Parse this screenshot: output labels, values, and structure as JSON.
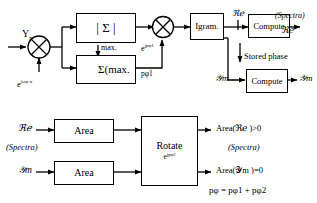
{
  "diagram": {
    "stroke_color": "#000000",
    "background": "#ffffff"
  },
  "top_section": {
    "input_label": "Y",
    "input_subscript": "n",
    "phase_ramp_label_base": "e",
    "phase_ramp_label_exp": "jωφ·n",
    "mult1_icon": "multiplier-circle-cross-icon",
    "mult2_icon": "multiplier-circle-cross-icon",
    "magnitude_box": "| Σ |",
    "angle_box_symbol": "∠",
    "angle_box_text": "Σ(max.",
    "max_label": "max.",
    "pphi1_exp_base": "e",
    "pphi1_exp": "jpφ1",
    "pphi1_label": "pφ1",
    "igram_box": "Igram.",
    "re_label": "ℜℯ",
    "im_label": "𝒴m",
    "compute_box_1": "Compute",
    "compute_box_2": "Compute",
    "stored_phase_label": "Stored phase",
    "spectra_note": "(Spectra)",
    "out_re_label": "ℜℯ",
    "out_im_label": "𝒴m",
    "in_im_label": "𝒴m"
  },
  "bottom_section": {
    "re_in_label": "ℜℯ",
    "spectra_note": "(Spectra)",
    "im_in_label": "𝒴m",
    "area_box_top": "Area",
    "area_box_bottom": "Area",
    "rotate_box": "Rotate",
    "rotate_exp_base": "e",
    "rotate_exp": "jpφ2",
    "result_re": "Area(ℜℯ )>0",
    "result_spectra": "(Spectra)",
    "result_im": "Area(𝒴m )=0",
    "result_equation": "pφ = pφ1 + pφ2"
  }
}
